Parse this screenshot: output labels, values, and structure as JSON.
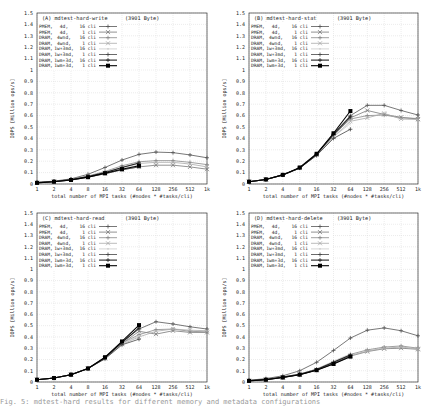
{
  "figure": {
    "x_ticks": [
      "1",
      "2",
      "4",
      "8",
      "16",
      "32",
      "64",
      "128",
      "256",
      "512",
      "1k"
    ],
    "y_ticks": [
      "0",
      "0.1",
      "0.2",
      "0.3",
      "0.4",
      "0.5",
      "0.6",
      "0.7",
      "0.8",
      "0.9",
      "1",
      "1.1",
      "1.2",
      "1.3",
      "1.4",
      "1.5"
    ],
    "xlabel": "total number of MPI tasks (#nodes * #tasks/cli)",
    "ylabel": "IOPS [Million ops/s]",
    "legend_entries": [
      {
        "mem": "PMEM,",
        "cfg": "4d,",
        "cli": "16 cli",
        "color": "#555555",
        "marker": "+"
      },
      {
        "mem": "PMEM,",
        "cfg": "4d,",
        "cli": "1 cli",
        "color": "#777777",
        "marker": "x"
      },
      {
        "mem": "DRAM,",
        "cfg": "4wnd,",
        "cli": "16 cli",
        "color": "#888888",
        "marker": "+"
      },
      {
        "mem": "DRAM,",
        "cfg": "4wnd,",
        "cli": "1 cli",
        "color": "#aaaaaa",
        "marker": "x"
      },
      {
        "mem": "DRAM,",
        "cfg": "1w+3md,",
        "cli": "16 cli",
        "color": "#cccccc",
        "marker": "."
      },
      {
        "mem": "DRAM,",
        "cfg": "1w+3md,",
        "cli": "1 cli",
        "color": "#444444",
        "marker": "+"
      },
      {
        "mem": "DRAM,",
        "cfg": "1wm+3d,",
        "cli": "16 cli",
        "color": "#222222",
        "marker": "+"
      },
      {
        "mem": "DRAM,",
        "cfg": "1wm+3d,",
        "cli": "1 cli",
        "color": "#000000",
        "marker": "square"
      }
    ]
  },
  "chart_data": [
    {
      "type": "line",
      "title": "(A) mdtest-hard-write",
      "subtitle": "(3901 Byte)",
      "xlabel": "total number of MPI tasks (#nodes * #tasks/cli)",
      "ylabel": "IOPS [Million ops/s]",
      "x": [
        1,
        2,
        4,
        8,
        16,
        32,
        64,
        128,
        256,
        512,
        1024
      ],
      "ylim": [
        0,
        1.5
      ],
      "grid": true,
      "legend_position": "top-left",
      "series": [
        {
          "name": "PMEM, 4d, 16 cli",
          "values": [
            0.015,
            0.025,
            0.045,
            0.085,
            0.145,
            0.21,
            0.26,
            0.28,
            0.275,
            0.255,
            0.23
          ]
        },
        {
          "name": "PMEM, 4d, 1 cli",
          "values": [
            0.01,
            0.02,
            0.035,
            0.06,
            0.09,
            0.125,
            0.15,
            0.165,
            0.165,
            0.15,
            0.13
          ]
        },
        {
          "name": "DRAM, 4wnd, 16 cli",
          "values": [
            0.012,
            0.022,
            0.04,
            0.07,
            0.11,
            0.16,
            0.195,
            0.205,
            0.205,
            0.19,
            0.17
          ]
        },
        {
          "name": "DRAM, 4wnd, 1 cli",
          "values": [
            0.01,
            0.02,
            0.035,
            0.062,
            0.1,
            0.145,
            0.18,
            0.19,
            0.19,
            0.175,
            0.15
          ]
        },
        {
          "name": "DRAM, 1w+3md, 16 cli",
          "values": [
            0.01,
            0.02,
            0.035,
            0.06,
            0.095,
            0.135,
            0.165,
            null,
            null,
            null,
            null
          ]
        },
        {
          "name": "DRAM, 1w+3md, 1 cli",
          "values": [
            0.01,
            0.02,
            0.035,
            0.06,
            0.09,
            0.125,
            0.15,
            null,
            null,
            null,
            null
          ]
        },
        {
          "name": "DRAM, 1wm+3d, 16 cli",
          "values": [
            0.012,
            0.022,
            0.04,
            0.065,
            0.1,
            0.145,
            0.185,
            null,
            null,
            null,
            null
          ]
        },
        {
          "name": "DRAM, 1wm+3d, 1 cli",
          "values": [
            0.01,
            0.02,
            0.035,
            0.06,
            0.095,
            0.13,
            0.16,
            null,
            null,
            null,
            null
          ]
        }
      ]
    },
    {
      "type": "line",
      "title": "(B) mdtest-hard-stat",
      "subtitle": "(3901 Byte)",
      "xlabel": "total number of MPI tasks (#nodes * #tasks/cli)",
      "ylabel": "IOPS [Million ops/s]",
      "x": [
        1,
        2,
        4,
        8,
        16,
        32,
        64,
        128,
        256,
        512,
        1024
      ],
      "ylim": [
        0,
        1.5
      ],
      "grid": true,
      "legend_position": "top-left",
      "series": [
        {
          "name": "PMEM, 4d, 16 cli",
          "values": [
            0.02,
            0.04,
            0.08,
            0.14,
            0.26,
            0.44,
            0.6,
            0.69,
            0.69,
            0.645,
            0.605
          ]
        },
        {
          "name": "PMEM, 4d, 1 cli",
          "values": [
            0.02,
            0.04,
            0.08,
            0.14,
            0.255,
            0.42,
            0.58,
            0.645,
            0.61,
            0.585,
            0.57
          ]
        },
        {
          "name": "DRAM, 4wnd, 16 cli",
          "values": [
            0.02,
            0.04,
            0.08,
            0.14,
            0.26,
            0.43,
            0.57,
            0.6,
            0.605,
            0.58,
            0.575
          ]
        },
        {
          "name": "DRAM, 4wnd, 1 cli",
          "values": [
            0.02,
            0.04,
            0.08,
            0.14,
            0.255,
            0.41,
            0.55,
            0.58,
            0.62,
            0.57,
            0.565
          ]
        },
        {
          "name": "DRAM, 1w+3md, 16 cli",
          "values": [
            0.02,
            0.04,
            0.08,
            0.14,
            0.255,
            0.415,
            0.53,
            null,
            null,
            null,
            null
          ]
        },
        {
          "name": "DRAM, 1w+3md, 1 cli",
          "values": [
            0.02,
            0.04,
            0.08,
            0.14,
            0.25,
            0.4,
            0.48,
            null,
            null,
            null,
            null
          ]
        },
        {
          "name": "DRAM, 1wm+3d, 16 cli",
          "values": [
            0.02,
            0.04,
            0.08,
            0.14,
            0.26,
            0.435,
            0.59,
            null,
            null,
            null,
            null
          ]
        },
        {
          "name": "DRAM, 1wm+3d, 1 cli",
          "values": [
            0.02,
            0.04,
            0.08,
            0.145,
            0.265,
            0.445,
            0.64,
            null,
            null,
            null,
            null
          ]
        }
      ]
    },
    {
      "type": "line",
      "title": "(C) mdtest-hard-read",
      "subtitle": "(3901 Byte)",
      "xlabel": "total number of MPI tasks (#nodes * #tasks/cli)",
      "ylabel": "IOPS [Million ops/s]",
      "x": [
        1,
        2,
        4,
        8,
        16,
        32,
        64,
        128,
        256,
        512,
        1024
      ],
      "ylim": [
        0,
        1.5
      ],
      "grid": true,
      "legend_position": "top-left",
      "series": [
        {
          "name": "PMEM, 4d, 16 cli",
          "values": [
            0.02,
            0.035,
            0.065,
            0.12,
            0.215,
            0.355,
            0.47,
            0.535,
            0.515,
            0.49,
            0.47
          ]
        },
        {
          "name": "PMEM, 4d, 1 cli",
          "values": [
            0.02,
            0.035,
            0.065,
            0.12,
            0.21,
            0.34,
            0.45,
            0.425,
            0.455,
            0.44,
            0.44
          ]
        },
        {
          "name": "DRAM, 4wnd, 16 cli",
          "values": [
            0.02,
            0.035,
            0.065,
            0.12,
            0.21,
            0.345,
            0.42,
            0.465,
            0.47,
            0.45,
            0.445
          ]
        },
        {
          "name": "DRAM, 4wnd, 1 cli",
          "values": [
            0.02,
            0.035,
            0.065,
            0.12,
            0.21,
            0.335,
            0.4,
            0.45,
            0.47,
            0.46,
            0.455
          ]
        },
        {
          "name": "DRAM, 1w+3md, 16 cli",
          "values": [
            0.02,
            0.035,
            0.065,
            0.12,
            0.21,
            0.34,
            0.41,
            null,
            null,
            null,
            null
          ]
        },
        {
          "name": "DRAM, 1w+3md, 1 cli",
          "values": [
            0.02,
            0.035,
            0.065,
            0.12,
            0.205,
            0.33,
            0.38,
            null,
            null,
            null,
            null
          ]
        },
        {
          "name": "DRAM, 1wm+3d, 16 cli",
          "values": [
            0.02,
            0.035,
            0.065,
            0.12,
            0.215,
            0.35,
            0.48,
            null,
            null,
            null,
            null
          ]
        },
        {
          "name": "DRAM, 1wm+3d, 1 cli",
          "values": [
            0.02,
            0.035,
            0.065,
            0.12,
            0.22,
            0.36,
            0.505,
            null,
            null,
            null,
            null
          ]
        }
      ]
    },
    {
      "type": "line",
      "title": "(D) mdtest-hard-delete",
      "subtitle": "(3901 Byte)",
      "xlabel": "total number of MPI tasks (#nodes * #tasks/cli)",
      "ylabel": "IOPS [Million ops/s]",
      "x": [
        1,
        2,
        4,
        8,
        16,
        32,
        64,
        128,
        256,
        512,
        1024
      ],
      "ylim": [
        0,
        1.5
      ],
      "grid": true,
      "legend_position": "top-left",
      "series": [
        {
          "name": "PMEM, 4d, 16 cli",
          "values": [
            0.015,
            0.03,
            0.055,
            0.1,
            0.175,
            0.28,
            0.39,
            0.46,
            0.48,
            0.455,
            0.41
          ]
        },
        {
          "name": "PMEM, 4d, 1 cli",
          "values": [
            0.01,
            0.02,
            0.04,
            0.065,
            0.105,
            0.16,
            0.23,
            0.27,
            0.295,
            0.3,
            0.29
          ]
        },
        {
          "name": "DRAM, 4wnd, 16 cli",
          "values": [
            0.012,
            0.025,
            0.045,
            0.07,
            0.115,
            0.18,
            0.245,
            0.285,
            0.31,
            0.32,
            0.3
          ]
        },
        {
          "name": "DRAM, 4wnd, 1 cli",
          "values": [
            0.01,
            0.022,
            0.042,
            0.068,
            0.11,
            0.17,
            0.235,
            0.275,
            0.3,
            0.31,
            0.295
          ]
        },
        {
          "name": "DRAM, 1w+3md, 16 cli",
          "values": [
            0.012,
            0.024,
            0.045,
            0.07,
            0.115,
            0.185,
            0.25,
            null,
            null,
            null,
            null
          ]
        },
        {
          "name": "DRAM, 1w+3md, 1 cli",
          "values": [
            0.01,
            0.02,
            0.04,
            0.065,
            0.105,
            0.165,
            0.23,
            null,
            null,
            null,
            null
          ]
        },
        {
          "name": "DRAM, 1wm+3d, 16 cli",
          "values": [
            0.012,
            0.023,
            0.043,
            0.068,
            0.11,
            0.175,
            0.24,
            null,
            null,
            null,
            null
          ]
        },
        {
          "name": "DRAM, 1wm+3d, 1 cli",
          "values": [
            0.01,
            0.02,
            0.04,
            0.065,
            0.105,
            0.16,
            0.225,
            null,
            null,
            null,
            null
          ]
        }
      ]
    }
  ],
  "caption": {
    "text": "Fig. 5: mdtest-hard results for different memory and metadata configurations"
  }
}
